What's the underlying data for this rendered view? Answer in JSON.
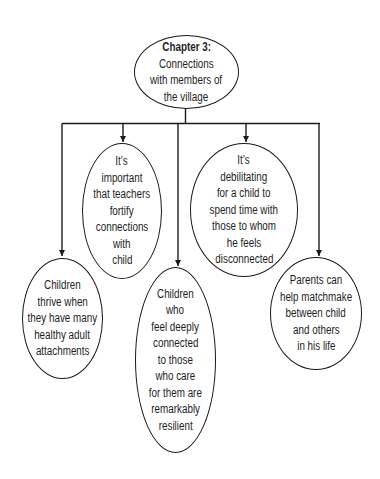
{
  "diagram": {
    "type": "tree",
    "root": {
      "title": "Chapter 3:",
      "lines": [
        "Connections",
        "with members of",
        "the village"
      ]
    },
    "children": [
      {
        "id": "n1",
        "lines": [
          "Children",
          "thrive when",
          "they have many",
          "healthy adult",
          "attachments"
        ]
      },
      {
        "id": "n2",
        "lines": [
          "It’s",
          "important",
          "that teachers",
          "fortify",
          "connections",
          "with",
          "child"
        ]
      },
      {
        "id": "n3",
        "lines": [
          "Children",
          "who",
          "feel deeply",
          "connected",
          "to those",
          "who care",
          "for them are",
          "remarkably",
          "resilient"
        ]
      },
      {
        "id": "n4",
        "lines": [
          "It’s",
          "debilitating",
          "for a child to",
          "spend time with",
          "those to whom",
          "he feels",
          "disconnected"
        ]
      },
      {
        "id": "n5",
        "lines": [
          "Parents can",
          "help matchmake",
          "between child",
          "and others",
          "in his life"
        ]
      }
    ],
    "colors": {
      "stroke": "#1a1a1a",
      "text": "#1e1e1e",
      "background": "#ffffff"
    }
  }
}
